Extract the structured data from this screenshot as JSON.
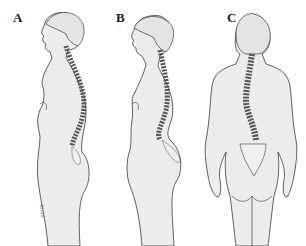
{
  "figure": {
    "panels": [
      {
        "id": "A",
        "label": "A",
        "view": "side-profile",
        "description": "Standing woman, side view, spine overlay with increased thoracic curve"
      },
      {
        "id": "B",
        "label": "B",
        "view": "side-profile",
        "description": "Standing woman, side view, spine overlay with exaggerated lumbar curve"
      },
      {
        "id": "C",
        "label": "C",
        "view": "posterior",
        "description": "Standing woman, back view, spine overlay with lateral S-curve"
      }
    ],
    "signature": "Rinta",
    "colors": {
      "background": "#ffffff",
      "skin_fill": "#ececec",
      "outline": "#3a3a3a",
      "vertebra_fill": "#f7f7f7"
    }
  }
}
